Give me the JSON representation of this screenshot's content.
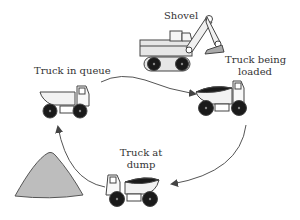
{
  "diagram": {
    "type": "cycle",
    "colors": {
      "outline": "#444444",
      "body_fill": "#e6e6e6",
      "wheel_fill": "#1a1a1a",
      "load_fill": "#1a1a1a",
      "pile_fill": "#bdbdbd",
      "arrow": "#555555"
    },
    "nodes": [
      {
        "id": "shovel",
        "label": "Shovel",
        "icon": "shovel-excavator-icon"
      },
      {
        "id": "queue",
        "label": "Truck in queue",
        "icon": "empty-dump-truck-icon"
      },
      {
        "id": "loaded",
        "label_line1": "Truck being",
        "label_line2": "loaded",
        "icon": "loaded-dump-truck-icon"
      },
      {
        "id": "dump",
        "label_line1": "Truck at",
        "label_line2": "dump",
        "icon": "dumping-truck-icon"
      },
      {
        "id": "pile",
        "label": "",
        "icon": "material-pile-icon"
      }
    ],
    "edges": [
      {
        "from": "queue",
        "to": "loaded"
      },
      {
        "from": "loaded",
        "to": "dump"
      },
      {
        "from": "dump",
        "to": "queue"
      }
    ]
  }
}
